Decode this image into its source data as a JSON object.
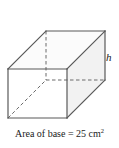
{
  "figure": {
    "name": "rectangular-prism-diagram",
    "shape": "rectangular prism",
    "projection": "oblique",
    "height_label": "h",
    "caption": {
      "prefix": "Area of base = ",
      "value": "25",
      "unit": "cm",
      "exponent": "2",
      "full_text": "Area of base = 25 cm²"
    },
    "colors": {
      "stroke": "#595959",
      "stroke_dark": "#3d3d3d",
      "top_face_fill": "#fbfbfb",
      "front_face_fill": "#ffffff",
      "right_face_fill": "#f2f2f2",
      "back_face_fill": "#f6f6f6",
      "text": "#1a1a1a",
      "background": "#ffffff"
    },
    "vertices": {
      "front_top_left": [
        8,
        69
      ],
      "front_top_right": [
        67,
        69
      ],
      "front_bottom_left": [
        8,
        118
      ],
      "front_bottom_right": [
        67,
        118
      ],
      "back_top_left": [
        46,
        31
      ],
      "back_top_right": [
        105,
        31
      ],
      "back_bottom_left": [
        46,
        80
      ],
      "back_bottom_right": [
        105,
        80
      ]
    },
    "edges": {
      "solid": [
        "front-top-left to front-top-right",
        "front-top-left to front-bottom-left",
        "front-top-right to front-bottom-right",
        "front-bottom-left to front-bottom-right",
        "back-top-left to back-top-right",
        "back-top-right to back-bottom-right",
        "front-top-left to back-top-left",
        "front-top-right to back-top-right",
        "front-bottom-right to back-bottom-right"
      ],
      "dashed_hidden": [
        "back-top-left to back-bottom-left",
        "back-bottom-left to back-bottom-right",
        "front-bottom-left to back-bottom-left"
      ]
    }
  }
}
